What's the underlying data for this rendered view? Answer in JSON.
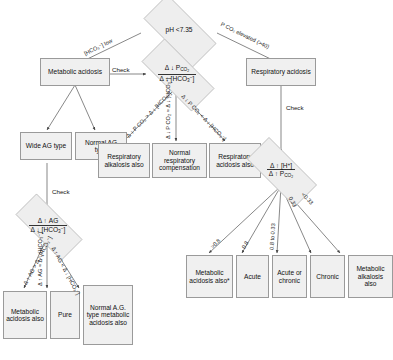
{
  "diagram": {
    "colors": {
      "node_fill": "#f0f0f0",
      "diamond_fill": "#eeeeee",
      "node_border": "#9a9a9a",
      "edge": "#555555",
      "text": "#111111"
    }
  },
  "nodes": {
    "ph_decision": "pH <7.35",
    "metabolic_acidosis": "Metabolic acidosis",
    "respiratory_acidosis": "Respiratory acidosis",
    "ratio_pco2_hco3": {
      "numerator": "Δ ↓ P",
      "numerator_sub": "CO2",
      "denominator": "Δ ↓ [HCO",
      "denominator_sub": "3",
      "denominator_tail": "⁻]"
    },
    "wide_ag": "Wide AG type",
    "normal_ag": "Normal AG type",
    "respiratory_alkalosis_also": "Respiratory alkalosis also",
    "normal_respiratory_compensation": "Normal respiratory compensation",
    "respiratory_acidosis_also": "Respiratory acidosis also",
    "ratio_h_pco2": {
      "numerator": "Δ ↑ [H⁺]",
      "denominator": "Δ ↑ P",
      "denominator_sub": "CO2"
    },
    "ratio_ag_hco3": {
      "numerator": "Δ ↑ AG",
      "denominator": "Δ ↓ [HCO",
      "denominator_sub": "3",
      "denominator_tail": "⁻]"
    },
    "metabolic_acidosis_also_left": "Metabolic acidosis also",
    "pure": "Pure",
    "normal_ag_metabolic_acidosis_also": "Normal A.G. type metabolic acidosis also",
    "metabolic_acidosis_also_right": "Metabolic acidosis also*",
    "acute": "Acute",
    "acute_or_chronic": "Acute or chronic",
    "chronic": "Chronic",
    "metabolic_alkalosis_also": "Metabolic alkalosis also"
  },
  "edge_labels": {
    "hco3_low": "[HCO₃⁻] low",
    "pco2_elevated": "P CO₂ elevated (>40)",
    "check_1": "Check",
    "check_2": "Check",
    "check_3": "Check",
    "pco2_gt_hco3": "Δ ↓ P CO₂ > Δ ↓ [HCO₃⁻]",
    "pco2_eq_hco3": "Δ ↓ P CO₂ ≈ Δ ↓ [HCO₃⁻]",
    "pco2_lt_hco3": "Δ ↓ P CO₂ < Δ ↓ [HCO₃⁻]",
    "ag_gt_hco3": "Δ ↑ AG > Δ ↓ [HCO₃⁻]",
    "ag_eq_hco3": "Δ ↑ AG ≈ Δ ↓ [HCO₃⁻]",
    "ag_lt_hco3": "Δ ↑ AG < Δ ↓ [HCO₃⁻]",
    "ratio_gt_08": ">0.8",
    "ratio_08": "0.8",
    "ratio_08_to_033": "0.8 to 0.33",
    "ratio_033": "0.33",
    "ratio_lt_033": "<0.33"
  }
}
